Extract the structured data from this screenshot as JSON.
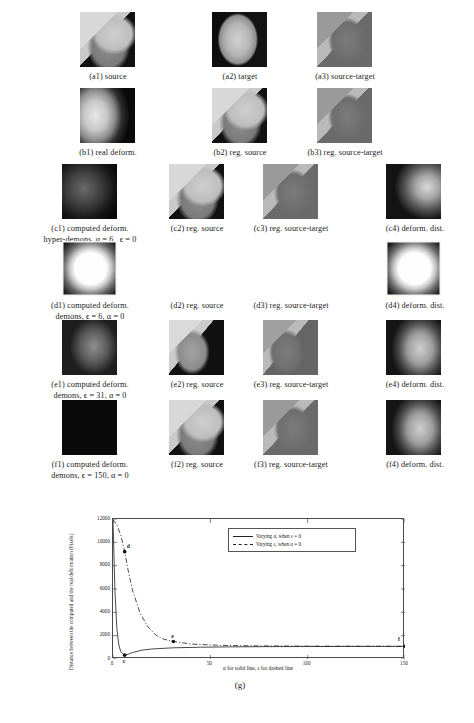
{
  "figure": {
    "panel_label": "(g)",
    "rows": [
      {
        "id": "a",
        "items": [
          {
            "tag": "a1",
            "caption": "(a1) source"
          },
          {
            "tag": "a2",
            "caption": "(a2) target"
          },
          {
            "tag": "a3",
            "caption": "(a3) source-target"
          }
        ]
      },
      {
        "id": "b",
        "items": [
          {
            "tag": "b1",
            "caption": "(b1) real deform."
          },
          {
            "tag": "b2",
            "caption": "(b2) reg. source"
          },
          {
            "tag": "b3",
            "caption": "(b3) reg. source-target"
          }
        ]
      },
      {
        "id": "c",
        "method_line1": "(c1) computed deform.",
        "method_line2": "hyper-demons, α = 6 , ϵ = 0",
        "items": [
          {
            "tag": "c1",
            "caption": "(c1) computed deform."
          },
          {
            "tag": "c2",
            "caption": "(c2) reg. source"
          },
          {
            "tag": "c3",
            "caption": "(c3) reg. source-target"
          },
          {
            "tag": "c4",
            "caption": "(c4) deform. dist."
          }
        ]
      },
      {
        "id": "d",
        "method_line1": "(d1) computed deform.",
        "method_line2": "demons, ϵ = 6, α = 0",
        "items": [
          {
            "tag": "d1",
            "caption": "(d1) computed deform."
          },
          {
            "tag": "d2",
            "caption": "(d2) reg. source"
          },
          {
            "tag": "d3",
            "caption": "(d3) reg. source-target"
          },
          {
            "tag": "d4",
            "caption": "(d4) deform. dist."
          }
        ]
      },
      {
        "id": "e",
        "method_line1": "(e1) computed deform.",
        "method_line2": "demons, ϵ = 31, α = 0",
        "items": [
          {
            "tag": "e1",
            "caption": "(e1) computed deform."
          },
          {
            "tag": "e2",
            "caption": "(e2) reg. source"
          },
          {
            "tag": "e3",
            "caption": "(e3) reg. source-target"
          },
          {
            "tag": "e4",
            "caption": "(e4) deform. dist."
          }
        ]
      },
      {
        "id": "f",
        "method_line1": "(f1) computed deform.",
        "method_line2": "demons, ϵ = 150, α = 0",
        "items": [
          {
            "tag": "f1",
            "caption": "(f1) computed deform."
          },
          {
            "tag": "f2",
            "caption": "(f2) reg. source"
          },
          {
            "tag": "f3",
            "caption": "(f3) reg. source-target"
          },
          {
            "tag": "f4",
            "caption": "(f4) deform. dist."
          }
        ]
      }
    ]
  },
  "chart_data": {
    "type": "line",
    "title": "",
    "xlabel": "α for solid line, ϵ for dashed line",
    "ylabel": "Distance between the computed and the real deformation (Pixels)",
    "xlim": [
      0,
      150
    ],
    "ylim": [
      0,
      12000
    ],
    "xticks": [
      0,
      50,
      100,
      150
    ],
    "xticklabels": [
      "0",
      "50",
      "100",
      "150"
    ],
    "yticks": [
      0,
      2000,
      4000,
      6000,
      8000,
      10000,
      12000
    ],
    "yticklabels": [
      "0",
      "2000",
      "4000",
      "6000",
      "8000",
      "10000",
      "12000"
    ],
    "grid": false,
    "legend_position": "upper right",
    "series": [
      {
        "name": "Varying α, when ϵ = 0",
        "style": "solid",
        "x": [
          0,
          1,
          2,
          3,
          4,
          6,
          8,
          10,
          15,
          20,
          31,
          45,
          60,
          80,
          100,
          125,
          150
        ],
        "y": [
          11900,
          5800,
          2600,
          1200,
          620,
          330,
          420,
          560,
          760,
          860,
          960,
          1010,
          1040,
          1060,
          1070,
          1075,
          1080
        ]
      },
      {
        "name": "Varying ϵ, when α = 0",
        "style": "dashed",
        "x": [
          0,
          2,
          4,
          6,
          8,
          10,
          14,
          18,
          22,
          26,
          31,
          40,
          55,
          70,
          90,
          110,
          130,
          150
        ],
        "y": [
          11950,
          11500,
          10600,
          9200,
          7400,
          5900,
          3900,
          2750,
          2050,
          1700,
          1500,
          1280,
          1170,
          1130,
          1110,
          1100,
          1095,
          1090
        ]
      }
    ],
    "annotations": [
      {
        "label": "c",
        "x": 6,
        "y": 330,
        "series": "Varying α, when ϵ = 0"
      },
      {
        "label": "d",
        "x": 6,
        "y": 9200,
        "series": "Varying ϵ, when α = 0"
      },
      {
        "label": "e",
        "x": 31,
        "y": 1500,
        "series": "Varying ϵ, when α = 0"
      },
      {
        "label": "f",
        "x": 150,
        "y": 1090,
        "series": "Varying ϵ, when α = 0"
      }
    ]
  }
}
